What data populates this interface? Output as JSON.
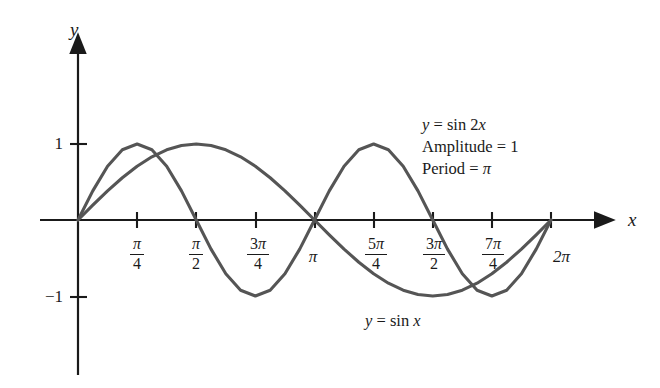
{
  "figure": {
    "background_color": "#ffffff",
    "axis_color": "#1a1a1a",
    "curve_color": "#555555"
  },
  "axes": {
    "x_axis_label": "x",
    "y_axis_label": "y",
    "y_ticks": [
      {
        "label": "1",
        "value": 1
      },
      {
        "label": "−1",
        "value": -1
      }
    ]
  },
  "annotation": {
    "line1_lhs": "y",
    "line1_eq": " = sin 2",
    "line1_var": "x",
    "line2": "Amplitude = 1",
    "line3_text": "Period = ",
    "line3_pi": "π"
  },
  "curve_labels": {
    "sinx_y": "y",
    "sinx_eq": " = sin ",
    "sinx_x": "x"
  },
  "chart_data": {
    "type": "line",
    "title": "",
    "xlabel": "x",
    "ylabel": "y",
    "xlim": [
      0,
      6.283185307179586
    ],
    "ylim": [
      -1.35,
      1.35
    ],
    "grid": false,
    "legend": "inline-annotations",
    "x_tick_values": [
      0.7853981633974483,
      1.5707963267948966,
      2.356194490192345,
      3.141592653589793,
      3.9269908169872414,
      4.71238898038469,
      5.497787143782138,
      6.283185307179586
    ],
    "x_tick_labels": [
      "π/4",
      "π/2",
      "3π/4",
      "π",
      "5π/4",
      "3π/2",
      "7π/4",
      "2π"
    ],
    "x_tick_label_parts": [
      {
        "type": "fraction",
        "num_coef": "",
        "num_pi": "π",
        "den": "4"
      },
      {
        "type": "fraction",
        "num_coef": "",
        "num_pi": "π",
        "den": "2"
      },
      {
        "type": "fraction",
        "num_coef": "3",
        "num_pi": "π",
        "den": "4"
      },
      {
        "type": "plain",
        "text": "π"
      },
      {
        "type": "fraction",
        "num_coef": "5",
        "num_pi": "π",
        "den": "4"
      },
      {
        "type": "fraction",
        "num_coef": "3",
        "num_pi": "π",
        "den": "2"
      },
      {
        "type": "fraction",
        "num_coef": "7",
        "num_pi": "π",
        "den": "4"
      },
      {
        "type": "plain",
        "text": "2π"
      }
    ],
    "y_tick_values": [
      1,
      -1
    ],
    "y_tick_labels": [
      "1",
      "−1"
    ],
    "series": [
      {
        "name": "y = sin 2x",
        "amplitude": 1,
        "period": 3.141592653589793,
        "color": "#555555",
        "x": [
          0,
          0.19634954,
          0.39269908,
          0.58904862,
          0.78539816,
          0.9817477,
          1.17809725,
          1.37444679,
          1.57079633,
          1.76714587,
          1.96349541,
          2.15984495,
          2.35619449,
          2.55254403,
          2.74889357,
          2.94524311,
          3.14159265,
          3.33794219,
          3.53429174,
          3.73064128,
          3.92699082,
          4.12334036,
          4.3196899,
          4.51603944,
          4.71238898,
          4.90873852,
          5.10508806,
          5.3014376,
          5.49778714,
          5.69413668,
          5.89048623,
          6.08683577,
          6.28318531
        ],
        "values": [
          0,
          0.38268343,
          0.70710678,
          0.92387953,
          1,
          0.92387953,
          0.70710678,
          0.38268343,
          0,
          -0.38268343,
          -0.70710678,
          -0.92387953,
          -1,
          -0.92387953,
          -0.70710678,
          -0.38268343,
          0,
          0.38268343,
          0.70710678,
          0.92387953,
          1,
          0.92387953,
          0.70710678,
          0.38268343,
          0,
          -0.38268343,
          -0.70710678,
          -0.92387953,
          -1,
          -0.92387953,
          -0.70710678,
          -0.38268343,
          0
        ]
      },
      {
        "name": "y = sin x",
        "amplitude": 1,
        "period": 6.283185307179586,
        "color": "#555555",
        "x": [
          0,
          0.19634954,
          0.39269908,
          0.58904862,
          0.78539816,
          0.9817477,
          1.17809725,
          1.37444679,
          1.57079633,
          1.76714587,
          1.96349541,
          2.15984495,
          2.35619449,
          2.55254403,
          2.74889357,
          2.94524311,
          3.14159265,
          3.33794219,
          3.53429174,
          3.73064128,
          3.92699082,
          4.12334036,
          4.3196899,
          4.51603944,
          4.71238898,
          4.90873852,
          5.10508806,
          5.3014376,
          5.49778714,
          5.69413668,
          5.89048623,
          6.08683577,
          6.28318531
        ],
        "values": [
          0,
          0.19509032,
          0.38268343,
          0.55557023,
          0.70710678,
          0.83146961,
          0.92387953,
          0.98078528,
          1,
          0.98078528,
          0.92387953,
          0.83146961,
          0.70710678,
          0.55557023,
          0.38268343,
          0.19509032,
          0,
          -0.19509032,
          -0.38268343,
          -0.55557023,
          -0.70710678,
          -0.83146961,
          -0.92387953,
          -0.98078528,
          -1,
          -0.98078528,
          -0.92387953,
          -0.83146961,
          -0.70710678,
          -0.55557023,
          -0.38268343,
          -0.19509032,
          0
        ]
      }
    ],
    "annotations": [
      {
        "text": "y = sin 2x",
        "x": 4.1,
        "y": 1.05
      },
      {
        "text": "Amplitude = 1",
        "x": 4.1,
        "y": 0.86
      },
      {
        "text": "Period = π",
        "x": 4.1,
        "y": 0.67
      },
      {
        "text": "y = sin x",
        "x": 3.9,
        "y": -1.12
      }
    ]
  }
}
